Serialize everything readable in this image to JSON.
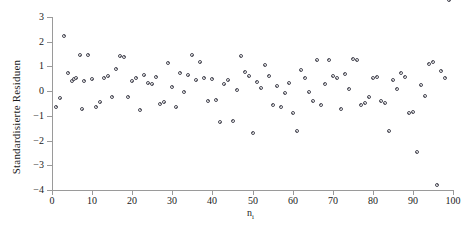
{
  "chart_data": {
    "type": "scatter",
    "title": "",
    "xlabel": "n",
    "xlabel_sub": "i",
    "ylabel": "Standardisierte Residuen",
    "xlim": [
      0,
      100
    ],
    "ylim": [
      -4,
      3
    ],
    "xticks": [
      0,
      10,
      20,
      30,
      40,
      50,
      60,
      70,
      80,
      90,
      100
    ],
    "yticks": [
      3,
      2,
      1,
      0,
      -1,
      -2,
      -3,
      -4
    ],
    "grid": false,
    "legend": null,
    "marker": "open-circle",
    "marker_color": "#4a4a55",
    "axis_color": "#9a9a9a",
    "x": [
      1,
      2,
      3,
      4,
      5,
      5.5,
      6,
      7,
      7.5,
      8,
      9,
      10,
      11,
      12,
      13,
      14,
      15,
      16,
      17,
      18,
      19,
      20,
      21,
      22,
      23,
      24,
      25,
      26,
      27,
      28,
      29,
      30,
      31,
      32,
      33,
      34,
      35,
      36,
      37,
      38,
      39,
      40,
      41,
      42,
      43,
      44,
      45,
      46,
      47,
      48,
      49,
      50,
      51,
      52,
      53,
      54,
      55,
      56,
      57,
      58,
      59,
      60,
      61,
      62,
      63,
      64,
      65,
      66,
      67,
      68,
      69,
      70,
      71,
      72,
      73,
      74,
      75,
      76,
      77,
      78,
      79,
      80,
      81,
      82,
      83,
      84,
      85,
      86,
      87,
      88,
      89,
      90,
      91,
      92,
      93,
      94,
      95,
      96,
      97,
      98,
      99
    ],
    "y": [
      -0.62,
      -0.28,
      2.25,
      0.75,
      0.42,
      0.5,
      0.52,
      1.45,
      -0.73,
      0.42,
      1.47,
      0.48,
      -0.62,
      -0.45,
      0.55,
      0.6,
      -0.22,
      0.9,
      1.42,
      1.4,
      -0.22,
      0.4,
      0.55,
      -0.75,
      0.65,
      0.32,
      0.28,
      0.58,
      -0.5,
      -0.45,
      1.15,
      0.18,
      -0.65,
      0.75,
      -0.02,
      0.65,
      1.45,
      0.45,
      1.18,
      0.55,
      -0.38,
      0.5,
      -0.35,
      -1.25,
      0.28,
      0.45,
      -1.2,
      0.05,
      1.42,
      0.78,
      0.6,
      -1.68,
      0.38,
      0.12,
      1.05,
      0.62,
      -0.55,
      0.2,
      -0.62,
      -0.08,
      0.32,
      -0.9,
      -1.62,
      0.85,
      0.55,
      -0.05,
      -0.4,
      1.25,
      -0.55,
      0.3,
      1.28,
      0.6,
      0.52,
      -0.72,
      0.7,
      0.1,
      1.32,
      1.25,
      -0.55,
      -0.48,
      -0.25,
      0.52,
      0.58,
      -0.4,
      -0.48,
      -1.62,
      0.45,
      0.1,
      0.75,
      0.58,
      -0.9,
      -0.85,
      -2.48,
      0.25,
      -0.2,
      1.12,
      1.2,
      -3.78,
      0.82,
      0.55
    ]
  }
}
